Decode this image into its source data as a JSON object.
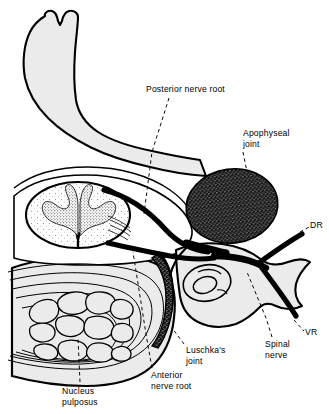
{
  "figure": {
    "type": "anatomical-diagram",
    "background_color": "#ffffff",
    "line_color": "#000000",
    "bone_fill": "#ebebeb",
    "cord_fill": "#ffffff",
    "joint_fill": "#111111",
    "luschka_fill": "#000000"
  },
  "labels": {
    "posterior_nerve_root": "Posterior nerve root",
    "apophyseal_joint_line1": "Apophyseal",
    "apophyseal_joint_line2": "joint",
    "dorsal_ramus": "DR",
    "ventral_ramus": "VR",
    "spinal_nerve_line1": "Spinal",
    "spinal_nerve_line2": "nerve",
    "luschka_joint_line1": "Luschka's",
    "luschka_joint_line2": "joint",
    "anterior_nerve_root_line1": "Anterior",
    "anterior_nerve_root_line2": "nerve root",
    "nucleus_pulposus_line1": "Nucleus",
    "nucleus_pulposus_line2": "pulposus"
  },
  "structures": [
    {
      "name": "spinous-process",
      "description": "Bifid spinous process, superior midline"
    },
    {
      "name": "vertebral-lamina",
      "description": "Lamina wings extending laterally"
    },
    {
      "name": "spinal-cord",
      "description": "Oval spinal cord with butterfly grey matter"
    },
    {
      "name": "intervertebral-disc",
      "description": "Annulus fibrosus concentric lamellae"
    },
    {
      "name": "nucleus-pulposus",
      "description": "Central fragmented nucleus of the disc"
    },
    {
      "name": "apophyseal-joint",
      "description": "Stippled dark oval facet joint, right lateral"
    },
    {
      "name": "luschka-joint",
      "description": "Dark crescent uncovertebral joint"
    },
    {
      "name": "transverse-process",
      "description": "Lateral bony projection with foramen"
    },
    {
      "name": "transverse-foramen",
      "description": "Oval opening in transverse process"
    },
    {
      "name": "posterior-nerve-root",
      "description": "Dorsal root leaving cord posteriorly"
    },
    {
      "name": "anterior-nerve-root",
      "description": "Ventral root leaving cord anteriorly"
    },
    {
      "name": "spinal-nerve",
      "description": "Combined spinal nerve trunk"
    },
    {
      "name": "dorsal-ramus",
      "description": "Posterior primary ramus, DR"
    },
    {
      "name": "ventral-ramus",
      "description": "Anterior primary ramus, VR"
    }
  ]
}
